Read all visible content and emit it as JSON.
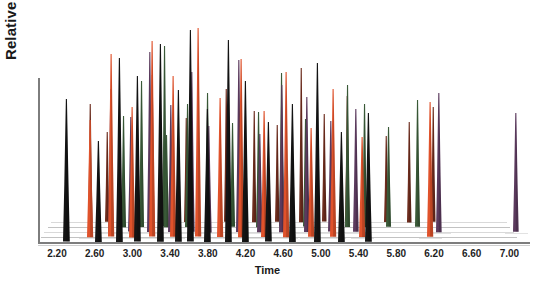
{
  "chart_data": {
    "type": "line",
    "render_style": "3d-stacked-waterfall-chromatogram",
    "title": "",
    "xlabel": "Time",
    "ylabel": "Relative intensity %",
    "xlim": [
      2.0,
      7.2
    ],
    "ylim": [
      0,
      100
    ],
    "grid": false,
    "legend": "none",
    "xticks": [
      "2.20",
      "2.60",
      "3.00",
      "3.40",
      "3.80",
      "4.20",
      "4.60",
      "5.00",
      "5.40",
      "5.80",
      "6.20",
      "6.60",
      "7.00"
    ],
    "xtick_values": [
      2.2,
      2.6,
      3.0,
      3.4,
      3.8,
      4.2,
      4.6,
      5.0,
      5.4,
      5.8,
      6.2,
      6.6,
      7.0
    ],
    "yticks": [],
    "ytick_labels": [],
    "series_colors": {
      "black": "#141414",
      "orange": "#e0522b",
      "purple": "#5c3a5e",
      "green": "#3a5a38",
      "brown": "#6d2c1d"
    },
    "series": [
      {
        "name": "trace-1",
        "color": "#141414",
        "depth": 0,
        "peaks": [
          {
            "x": 2.3,
            "y": 62
          },
          {
            "x": 2.64,
            "y": 44
          },
          {
            "x": 2.86,
            "y": 80
          },
          {
            "x": 3.05,
            "y": 72
          },
          {
            "x": 3.3,
            "y": 86
          },
          {
            "x": 3.49,
            "y": 66
          },
          {
            "x": 3.62,
            "y": 92
          },
          {
            "x": 3.8,
            "y": 58
          },
          {
            "x": 4.02,
            "y": 88
          },
          {
            "x": 4.2,
            "y": 70
          },
          {
            "x": 4.44,
            "y": 52
          },
          {
            "x": 4.7,
            "y": 60
          },
          {
            "x": 4.96,
            "y": 78
          },
          {
            "x": 5.22,
            "y": 48
          },
          {
            "x": 5.5,
            "y": 56
          }
        ]
      },
      {
        "name": "trace-2",
        "color": "#e0522b",
        "depth": 1,
        "peaks": [
          {
            "x": 2.52,
            "y": 54
          },
          {
            "x": 2.74,
            "y": 84
          },
          {
            "x": 2.96,
            "y": 60
          },
          {
            "x": 3.18,
            "y": 90
          },
          {
            "x": 3.4,
            "y": 74
          },
          {
            "x": 3.66,
            "y": 96
          },
          {
            "x": 3.9,
            "y": 64
          },
          {
            "x": 4.12,
            "y": 82
          },
          {
            "x": 4.36,
            "y": 58
          },
          {
            "x": 4.6,
            "y": 76
          },
          {
            "x": 4.86,
            "y": 50
          },
          {
            "x": 5.1,
            "y": 68
          },
          {
            "x": 5.4,
            "y": 46
          },
          {
            "x": 6.12,
            "y": 62
          }
        ]
      },
      {
        "name": "trace-3",
        "color": "#5c3a5e",
        "depth": 2,
        "peaks": [
          {
            "x": 2.7,
            "y": 70
          },
          {
            "x": 2.92,
            "y": 56
          },
          {
            "x": 3.12,
            "y": 88
          },
          {
            "x": 3.34,
            "y": 62
          },
          {
            "x": 3.56,
            "y": 78
          },
          {
            "x": 3.74,
            "y": 52
          },
          {
            "x": 4.06,
            "y": 84
          },
          {
            "x": 4.28,
            "y": 48
          },
          {
            "x": 4.52,
            "y": 72
          },
          {
            "x": 4.78,
            "y": 66
          },
          {
            "x": 5.04,
            "y": 54
          },
          {
            "x": 5.3,
            "y": 60
          },
          {
            "x": 6.18,
            "y": 68
          },
          {
            "x": 7.0,
            "y": 58
          }
        ]
      },
      {
        "name": "trace-4",
        "color": "#3a5a38",
        "depth": 3,
        "peaks": [
          {
            "x": 2.8,
            "y": 58
          },
          {
            "x": 3.0,
            "y": 76
          },
          {
            "x": 3.24,
            "y": 94
          },
          {
            "x": 3.26,
            "y": 48
          },
          {
            "x": 3.48,
            "y": 64
          },
          {
            "x": 3.7,
            "y": 70
          },
          {
            "x": 3.96,
            "y": 54
          },
          {
            "x": 4.24,
            "y": 60
          },
          {
            "x": 4.48,
            "y": 80
          },
          {
            "x": 4.74,
            "y": 56
          },
          {
            "x": 5.18,
            "y": 74
          },
          {
            "x": 5.36,
            "y": 64
          },
          {
            "x": 5.62,
            "y": 52
          },
          {
            "x": 5.92,
            "y": 66
          }
        ]
      },
      {
        "name": "trace-5",
        "color": "#6d2c1d",
        "depth": 4,
        "peaks": [
          {
            "x": 2.42,
            "y": 66
          },
          {
            "x": 2.6,
            "y": 50
          },
          {
            "x": 3.08,
            "y": 82
          },
          {
            "x": 3.44,
            "y": 58
          },
          {
            "x": 3.86,
            "y": 74
          },
          {
            "x": 4.16,
            "y": 62
          },
          {
            "x": 4.4,
            "y": 54
          },
          {
            "x": 4.66,
            "y": 86
          },
          {
            "x": 4.9,
            "y": 60
          },
          {
            "x": 5.14,
            "y": 70
          },
          {
            "x": 5.56,
            "y": 48
          },
          {
            "x": 5.8,
            "y": 56
          },
          {
            "x": 6.06,
            "y": 64
          }
        ]
      }
    ]
  }
}
